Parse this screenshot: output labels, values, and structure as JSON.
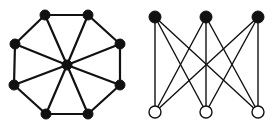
{
  "figure": {
    "width": 274,
    "height": 125,
    "background": "#ffffff",
    "edge_color": "#111111",
    "filled_node_color": "#111111",
    "hollow_node_fill": "#ffffff"
  },
  "graphs": [
    {
      "name": "wheel-octagon",
      "description": "Octagon cycle with central hub connected to all 8 outer vertices (wheel graph W9)",
      "node_radius": 5,
      "edge_width": 2.2,
      "nodes": [
        {
          "id": "a",
          "x": 45,
          "y": 15,
          "style": "filled"
        },
        {
          "id": "b",
          "x": 88,
          "y": 15,
          "style": "filled"
        },
        {
          "id": "c",
          "x": 120,
          "y": 44,
          "style": "filled"
        },
        {
          "id": "d",
          "x": 120,
          "y": 85,
          "style": "filled"
        },
        {
          "id": "e",
          "x": 88,
          "y": 114,
          "style": "filled"
        },
        {
          "id": "f",
          "x": 46,
          "y": 114,
          "style": "filled"
        },
        {
          "id": "g",
          "x": 14,
          "y": 85,
          "style": "filled"
        },
        {
          "id": "h",
          "x": 15,
          "y": 44,
          "style": "filled"
        },
        {
          "id": "hub",
          "x": 67,
          "y": 65,
          "style": "filled"
        }
      ],
      "edges": [
        [
          "a",
          "b"
        ],
        [
          "b",
          "c"
        ],
        [
          "c",
          "d"
        ],
        [
          "d",
          "e"
        ],
        [
          "e",
          "f"
        ],
        [
          "f",
          "g"
        ],
        [
          "g",
          "h"
        ],
        [
          "h",
          "a"
        ],
        [
          "hub",
          "a"
        ],
        [
          "hub",
          "b"
        ],
        [
          "hub",
          "c"
        ],
        [
          "hub",
          "d"
        ],
        [
          "hub",
          "e"
        ],
        [
          "hub",
          "f"
        ],
        [
          "hub",
          "g"
        ],
        [
          "hub",
          "h"
        ]
      ]
    },
    {
      "name": "complete-bipartite-k33",
      "description": "Complete bipartite graph K3,3 with 3 filled top nodes and 3 hollow bottom nodes",
      "node_radius": 6,
      "edge_width": 1.4,
      "nodes": [
        {
          "id": "t1",
          "x": 155,
          "y": 17,
          "style": "filled"
        },
        {
          "id": "t2",
          "x": 206,
          "y": 17,
          "style": "filled"
        },
        {
          "id": "t3",
          "x": 258,
          "y": 17,
          "style": "filled"
        },
        {
          "id": "b1",
          "x": 155,
          "y": 112,
          "style": "hollow"
        },
        {
          "id": "b2",
          "x": 206,
          "y": 112,
          "style": "hollow"
        },
        {
          "id": "b3",
          "x": 258,
          "y": 112,
          "style": "hollow"
        }
      ],
      "edges": [
        [
          "t1",
          "b1"
        ],
        [
          "t1",
          "b2"
        ],
        [
          "t1",
          "b3"
        ],
        [
          "t2",
          "b1"
        ],
        [
          "t2",
          "b2"
        ],
        [
          "t2",
          "b3"
        ],
        [
          "t3",
          "b1"
        ],
        [
          "t3",
          "b2"
        ],
        [
          "t3",
          "b3"
        ]
      ]
    }
  ]
}
